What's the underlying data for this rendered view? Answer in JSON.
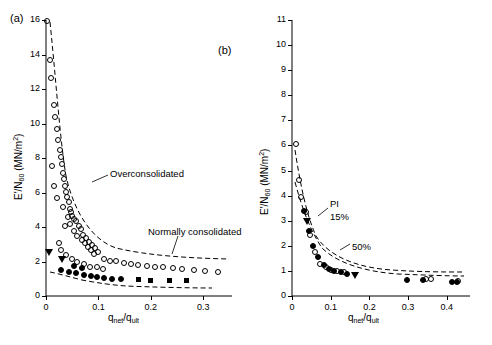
{
  "figure": {
    "panel_a_label": "(a)",
    "panel_b_label": "(b)"
  },
  "chart_data": [
    {
      "type": "scatter",
      "panel": "(a)",
      "title": "",
      "xlabel": "q_net / q_ult",
      "xlabel_parts": {
        "main1": "q",
        "sub1": "net",
        "slash": "/",
        "main2": "q",
        "sub2": "ult"
      },
      "ylabel": "E'/N60 (MN/m2)",
      "ylabel_parts": {
        "main1": "E'/N",
        "sub1": "60",
        "unit_open": " (MN/m",
        "sup": "2",
        "unit_close": ")"
      },
      "xlim": [
        0,
        0.355
      ],
      "ylim": [
        0,
        16
      ],
      "xticks": [
        0,
        0.1,
        0.2,
        0.3
      ],
      "xticklabels": [
        "0",
        "0.1",
        "0.2",
        "0.3"
      ],
      "yticks": [
        0,
        2,
        4,
        6,
        8,
        10,
        12,
        14,
        16
      ],
      "yticklabels": [
        "0",
        "2",
        "4",
        "6",
        "8",
        "10",
        "12",
        "14",
        "16"
      ],
      "grid": false,
      "legend": "none",
      "annotations": [
        {
          "text": "Overconsolidated",
          "x": 0.105,
          "y": 5.15
        },
        {
          "text": "Normally consolidated",
          "x": 0.175,
          "y": 2.55
        }
      ],
      "series": [
        {
          "name": "Overconsolidated (open circles)",
          "marker": "open-circle",
          "points": [
            [
              0.004,
              15.9
            ],
            [
              0.01,
              13.6
            ],
            [
              0.012,
              12.6
            ],
            [
              0.017,
              11.0
            ],
            [
              0.02,
              10.3
            ],
            [
              0.022,
              9.6
            ],
            [
              0.025,
              9.0
            ],
            [
              0.028,
              8.4
            ],
            [
              0.03,
              8.0
            ],
            [
              0.032,
              7.6
            ],
            [
              0.034,
              7.1
            ],
            [
              0.036,
              6.7
            ],
            [
              0.038,
              6.3
            ],
            [
              0.04,
              6.0
            ],
            [
              0.042,
              5.7
            ],
            [
              0.045,
              5.4
            ],
            [
              0.034,
              5.1
            ],
            [
              0.048,
              5.0
            ],
            [
              0.05,
              4.8
            ],
            [
              0.052,
              4.6
            ],
            [
              0.044,
              4.5
            ],
            [
              0.056,
              4.4
            ],
            [
              0.06,
              4.3
            ],
            [
              0.048,
              4.1
            ],
            [
              0.064,
              4.0
            ],
            [
              0.038,
              4.0
            ],
            [
              0.068,
              3.8
            ],
            [
              0.056,
              3.7
            ],
            [
              0.072,
              3.5
            ],
            [
              0.062,
              3.4
            ],
            [
              0.078,
              3.3
            ],
            [
              0.07,
              3.2
            ],
            [
              0.084,
              3.1
            ],
            [
              0.076,
              3.0
            ],
            [
              0.09,
              2.9
            ],
            [
              0.082,
              2.8
            ],
            [
              0.096,
              2.7
            ],
            [
              0.088,
              2.6
            ],
            [
              0.102,
              2.5
            ],
            [
              0.094,
              2.4
            ],
            [
              0.026,
              3.0
            ],
            [
              0.03,
              2.6
            ],
            [
              0.04,
              2.3
            ],
            [
              0.052,
              2.1
            ],
            [
              0.062,
              1.9
            ],
            [
              0.074,
              1.8
            ],
            [
              0.086,
              1.65
            ],
            [
              0.1,
              1.6
            ],
            [
              0.112,
              2.1
            ],
            [
              0.124,
              2.0
            ],
            [
              0.136,
              1.95
            ],
            [
              0.15,
              1.85
            ],
            [
              0.164,
              1.8
            ],
            [
              0.178,
              1.75
            ],
            [
              0.194,
              1.7
            ],
            [
              0.21,
              1.65
            ],
            [
              0.226,
              1.6
            ],
            [
              0.244,
              1.55
            ],
            [
              0.262,
              1.5
            ],
            [
              0.284,
              1.45
            ],
            [
              0.306,
              1.4
            ],
            [
              0.33,
              1.35
            ],
            [
              0.014,
              7.5
            ],
            [
              0.018,
              6.3
            ],
            [
              0.022,
              5.6
            ],
            [
              0.11,
              1.5
            ]
          ]
        },
        {
          "name": "Normally consolidated (filled circles)",
          "marker": "filled-circle",
          "points": [
            [
              0.03,
              1.45
            ],
            [
              0.046,
              1.35
            ],
            [
              0.06,
              1.25
            ],
            [
              0.074,
              1.15
            ],
            [
              0.088,
              1.1
            ],
            [
              0.1,
              1.05
            ],
            [
              0.112,
              1.0
            ],
            [
              0.128,
              0.95
            ],
            [
              0.146,
              0.92
            ],
            [
              0.07,
              1.55
            ],
            [
              0.056,
              1.7
            ]
          ]
        },
        {
          "name": "Normally consolidated (filled squares)",
          "marker": "filled-square",
          "points": [
            [
              0.176,
              0.95
            ],
            [
              0.2,
              0.92
            ],
            [
              0.236,
              0.9
            ],
            [
              0.268,
              0.88
            ]
          ]
        },
        {
          "name": "Filled triangles",
          "marker": "filled-triangle",
          "points": [
            [
              0.006,
              2.5
            ],
            [
              0.03,
              2.1
            ]
          ]
        }
      ],
      "curves": [
        {
          "name": "upper dashed trend",
          "style": "dashed"
        },
        {
          "name": "lower dashed trend",
          "style": "dashed"
        }
      ]
    },
    {
      "type": "scatter",
      "panel": "(b)",
      "title": "",
      "xlabel": "q_net / q_ult",
      "xlabel_parts": {
        "main1": "q",
        "sub1": "net",
        "slash": "/",
        "main2": "q",
        "sub2": "ult"
      },
      "ylabel": "E'/N60 (MN/m2)",
      "ylabel_parts": {
        "main1": "E'/N",
        "sub1": "60",
        "unit_open": " (MN/m",
        "sup": "2",
        "unit_close": ")"
      },
      "xlim": [
        0,
        0.46
      ],
      "ylim": [
        0,
        11
      ],
      "xticks": [
        0,
        0.1,
        0.2,
        0.3,
        0.4
      ],
      "xticklabels": [
        "0",
        "0.1",
        "0.2",
        "0.3",
        "0.4"
      ],
      "yticks": [
        0,
        1,
        2,
        3,
        4,
        5,
        6,
        7,
        8,
        9,
        10,
        11
      ],
      "yticklabels": [
        "0",
        "1",
        "2",
        "3",
        "4",
        "5",
        "6",
        "7",
        "8",
        "9",
        "10",
        "11"
      ],
      "grid": false,
      "legend": "none",
      "annotations": [
        {
          "text": "PI",
          "x": 0.085,
          "y": 4.15
        },
        {
          "text": "15%",
          "x": 0.085,
          "y": 3.6
        },
        {
          "text": "50%",
          "x": 0.135,
          "y": 2.35
        }
      ],
      "series": [
        {
          "name": "Open circles",
          "marker": "open-circle",
          "points": [
            [
              0.013,
              6.0
            ],
            [
              0.02,
              4.6
            ],
            [
              0.026,
              3.9
            ],
            [
              0.04,
              3.3
            ],
            [
              0.05,
              2.4
            ],
            [
              0.062,
              1.7
            ],
            [
              0.076,
              1.25
            ],
            [
              0.09,
              1.1
            ],
            [
              0.104,
              1.0
            ],
            [
              0.12,
              0.95
            ],
            [
              0.138,
              0.9
            ],
            [
              0.35,
              0.65
            ],
            [
              0.362,
              0.62
            ],
            [
              0.432,
              0.55
            ]
          ]
        },
        {
          "name": "Filled circles",
          "marker": "filled-circle",
          "points": [
            [
              0.033,
              3.35
            ],
            [
              0.046,
              2.55
            ],
            [
              0.058,
              1.95
            ],
            [
              0.07,
              1.5
            ],
            [
              0.084,
              1.2
            ],
            [
              0.098,
              1.05
            ],
            [
              0.112,
              0.95
            ],
            [
              0.128,
              0.9
            ],
            [
              0.145,
              0.85
            ],
            [
              0.3,
              0.6
            ],
            [
              0.342,
              0.58
            ],
            [
              0.415,
              0.5
            ],
            [
              0.428,
              0.5
            ]
          ]
        },
        {
          "name": "Filled triangles",
          "marker": "filled-triangle",
          "points": [
            [
              0.04,
              2.95
            ],
            [
              0.162,
              0.8
            ]
          ]
        }
      ],
      "curves": [
        {
          "name": "PI 15% dashed curve",
          "style": "dashed"
        },
        {
          "name": "PI 50% dashed curve",
          "style": "dashed"
        }
      ]
    }
  ]
}
